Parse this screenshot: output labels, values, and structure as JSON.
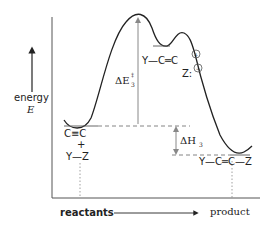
{
  "diagram": {
    "type": "reaction-energy-profile",
    "axis": {
      "y_label_line1": "energy",
      "y_label_line2": "E",
      "x_label_start": "reactants",
      "x_label_end": "product"
    },
    "species": {
      "reactant_top": "C≡C",
      "reactant_plus": "+",
      "reactant_bottom": "Y—Z",
      "intermediate": "Y—C═C",
      "intermediate_charge": "+",
      "nucleophile": "Z:",
      "nucleophile_charge": "−",
      "product": "Y—C═C—Z"
    },
    "annotations": {
      "activation_symbol": "ΔE",
      "activation_superscript": "‡",
      "activation_subscript": "3",
      "enthalpy_symbol": "ΔH",
      "enthalpy_subscript": "3"
    },
    "colors": {
      "curve": "#222222",
      "axis": "#555555",
      "dashed": "#777777",
      "arrow": "#888888"
    }
  }
}
